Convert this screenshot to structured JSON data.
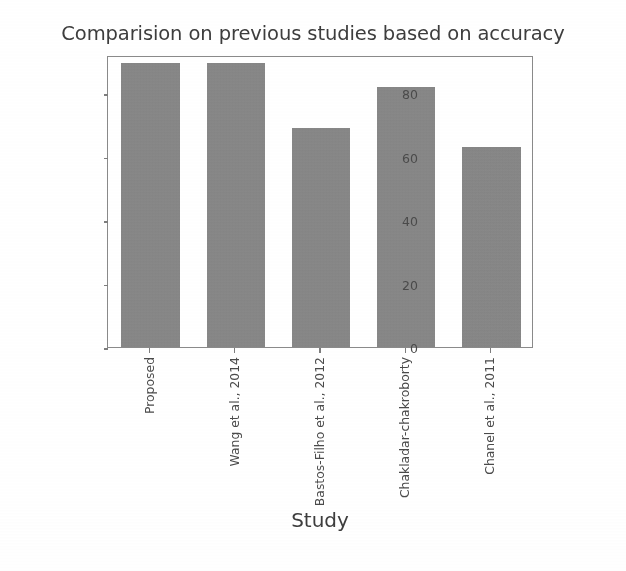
{
  "chart_data": {
    "type": "bar",
    "title": "Comparision on previous studies based on accuracy",
    "xlabel": "Study",
    "ylabel": "Accuracy(%)",
    "categories": [
      "Proposed",
      "Wang et al., 2014",
      "Bastos-Filho et al., 2012",
      "Chakladar-chakroborty",
      "Chanel et al., 2011"
    ],
    "values": [
      89.5,
      89.5,
      69.0,
      82.0,
      63.0
    ],
    "ylim": [
      0,
      92
    ],
    "ytick_labels": [
      "0",
      "20",
      "40",
      "60",
      "80"
    ],
    "ytick_values": [
      0,
      20,
      40,
      60,
      80
    ],
    "grid": false,
    "legend": "none",
    "bar_color": "#888888",
    "axis_color": "#8a8a8a",
    "text_color": "#3d3d3d",
    "background_color": "#ffffff"
  }
}
